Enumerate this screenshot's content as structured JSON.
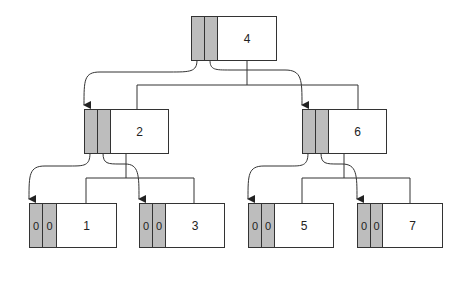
{
  "diagram": {
    "type": "binary-tree",
    "colors": {
      "pointer_cell": "#bdbdbd",
      "line": "#333333",
      "background": "#ffffff"
    },
    "nodes": {
      "root": {
        "key": "4",
        "left": "",
        "right": ""
      },
      "n2": {
        "key": "2",
        "left": "",
        "right": ""
      },
      "n6": {
        "key": "6",
        "left": "",
        "right": ""
      },
      "n1": {
        "key": "1",
        "left": "0",
        "right": "0"
      },
      "n3": {
        "key": "3",
        "left": "0",
        "right": "0"
      },
      "n5": {
        "key": "5",
        "left": "0",
        "right": "0"
      },
      "n7": {
        "key": "7",
        "left": "0",
        "right": "0"
      }
    }
  }
}
